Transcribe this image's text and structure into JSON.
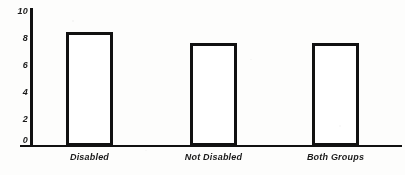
{
  "chart_data": {
    "type": "bar",
    "title": "",
    "xlabel": "",
    "ylabel": "",
    "categories": [
      "Disabled",
      "Not Disabled",
      "Both Groups"
    ],
    "values": [
      8.4,
      7.6,
      7.6
    ],
    "ylim": [
      0,
      10
    ],
    "yticks": [
      0,
      2,
      4,
      6,
      8,
      10
    ],
    "ytick_labels": [
      "0",
      "2",
      "4",
      "6",
      "8",
      "10"
    ],
    "grid": false,
    "legend": null,
    "bar_style": {
      "fill": "#ffffff",
      "outline": "#111111",
      "outline_width_px": 3
    },
    "axis_color": "#111111",
    "background": "#fdfdfc"
  },
  "axes": {
    "y_tick_labels": [
      "10",
      "8",
      "6",
      "4",
      "2",
      "0"
    ],
    "x_tick_labels": [
      "Disabled",
      "Not Disabled",
      "Both Groups"
    ]
  }
}
